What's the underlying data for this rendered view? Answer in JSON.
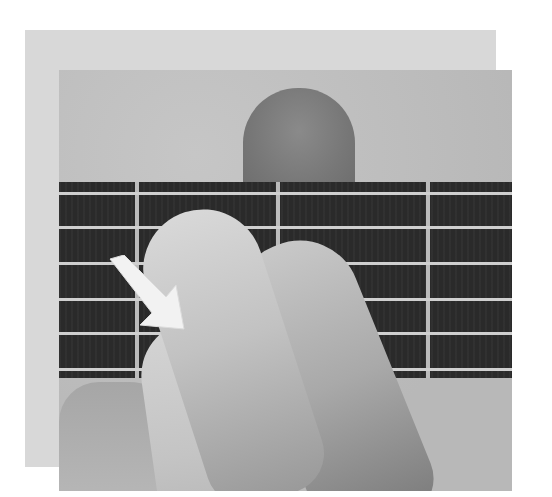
{
  "image": {
    "description": "Grayscale photo of a hand fretting guitar strings; a white arrow points to the fingertip touching the lower strings",
    "colors": {
      "frame": "#d8d8d8",
      "background": "#bdbdbd",
      "fretboard": "#2a2a2a",
      "strings": "#cfcfcf",
      "frets": "#bcbcbc",
      "arrow": "#f2f2f2"
    },
    "strings_count": 6,
    "visible_frets": 3
  }
}
